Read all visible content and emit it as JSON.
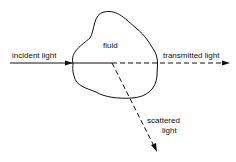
{
  "diagram": {
    "labels": {
      "fluid": "fluid",
      "incident": "incident light",
      "transmitted": "transmitted light",
      "scattered_line1": "scattered",
      "scattered_line2": "light"
    },
    "stroke_color": "#111111"
  }
}
